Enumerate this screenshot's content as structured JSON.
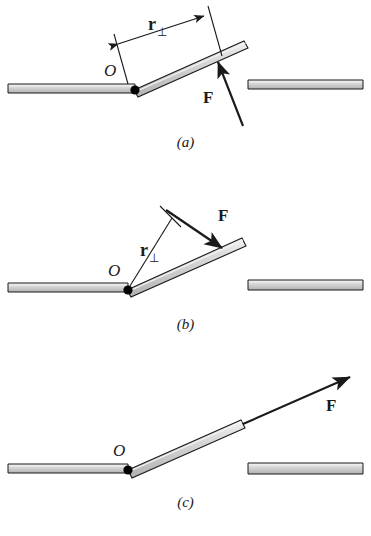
{
  "figure": {
    "background_color": "#ffffff",
    "ink_color": "#1a1a1a",
    "rod_fill_color": "#c9c9c9",
    "rod_highlight_color": "#eeeeee",
    "rod_outline_color": "#1a1a1a",
    "pivot_color": "#000000"
  },
  "panels": [
    {
      "id": "a",
      "caption": "(a)",
      "pivot_label": "O",
      "force_label": "F",
      "moment_arm_label": "r",
      "moment_arm_subscript": "⊥",
      "force_direction": "up-left",
      "moment_arm_shown": true,
      "moment_arm_description": "perpendicular distance measured along the rod from the pivot to the line of action"
    },
    {
      "id": "b",
      "caption": "(b)",
      "pivot_label": "O",
      "force_label": "F",
      "moment_arm_label": "r",
      "moment_arm_subscript": "⊥",
      "force_direction": "down-right",
      "moment_arm_shown": true,
      "moment_arm_description": "perpendicular distance from pivot to the line of action of the force"
    },
    {
      "id": "c",
      "caption": "(c)",
      "pivot_label": "O",
      "force_label": "F",
      "moment_arm_label": null,
      "moment_arm_subscript": null,
      "force_direction": "up-right along the rod axis",
      "moment_arm_shown": false,
      "moment_arm_description": "line of action passes through the pivot, so the moment arm is zero"
    }
  ]
}
